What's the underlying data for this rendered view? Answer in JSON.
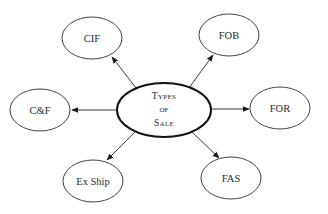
{
  "diagram": {
    "center": {
      "lines": [
        "Types",
        "of",
        "Sale"
      ]
    },
    "nodes": [
      {
        "id": "cif",
        "label": "CIF"
      },
      {
        "id": "fob",
        "label": "FOB"
      },
      {
        "id": "cf",
        "label": "C&F"
      },
      {
        "id": "for",
        "label": "FOR"
      },
      {
        "id": "exship",
        "label": "Ex Ship"
      },
      {
        "id": "fas",
        "label": "FAS"
      }
    ],
    "colors": {
      "stroke": "#2a2a2a",
      "background": "#ffffff"
    }
  }
}
